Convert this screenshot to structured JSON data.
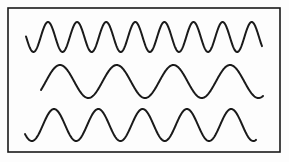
{
  "figure": {
    "background_color": "#fdfdfd",
    "stroke_color": "#1a1a1a",
    "frame": {
      "x": 8,
      "y": 8,
      "width": 272,
      "height": 144,
      "stroke_width": 1.6
    },
    "waves": [
      {
        "name": "top-wave",
        "cycles_visible": 8,
        "x_start": 26,
        "x_end": 262,
        "center_y": 37,
        "amplitude": 15,
        "period": 29.1,
        "first_peak_x": 48,
        "stroke_width": 2
      },
      {
        "name": "middle-wave",
        "cycles_visible": 4,
        "x_start": 41,
        "x_end": 263,
        "center_y": 81.5,
        "amplitude": 16.5,
        "period": 56.7,
        "first_peak_x": 60,
        "stroke_width": 2
      },
      {
        "name": "bottom-wave",
        "cycles_visible": 5,
        "x_start": 25,
        "x_end": 256,
        "center_y": 125,
        "amplitude": 16,
        "period": 44.3,
        "first_peak_x": 54,
        "stroke_width": 2
      }
    ]
  }
}
